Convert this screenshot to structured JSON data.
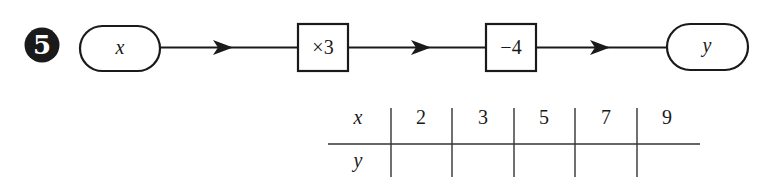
{
  "problem": {
    "number": "5"
  },
  "flow": {
    "input": "x",
    "steps": [
      {
        "label": "×3"
      },
      {
        "label": "−4"
      }
    ],
    "output": "y"
  },
  "table": {
    "row_headers": [
      "x",
      "y"
    ],
    "x_values": [
      "2",
      "3",
      "5",
      "7",
      "9"
    ],
    "y_values": [
      "",
      "",
      "",
      "",
      ""
    ]
  },
  "colors": {
    "ink": "#1a1a1a",
    "background": "#ffffff"
  }
}
